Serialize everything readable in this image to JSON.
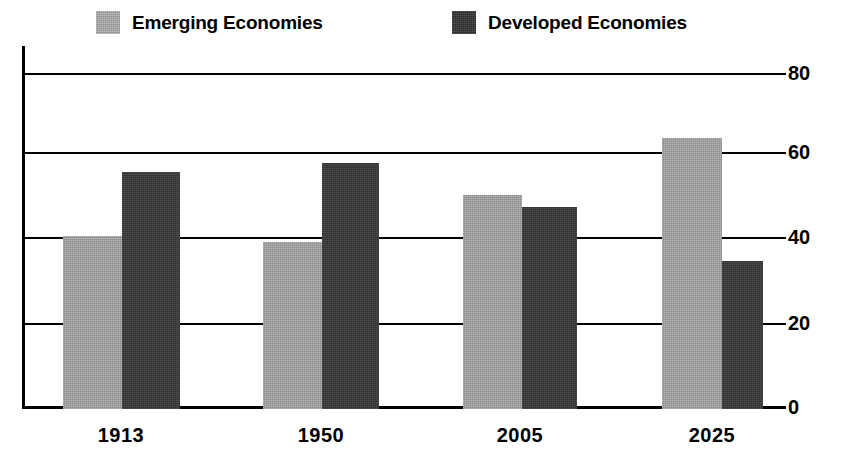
{
  "chart_data": {
    "type": "bar",
    "title": "",
    "subtitle": "",
    "xlabel": "",
    "ylabel": "",
    "categories": [
      "1913",
      "1950",
      "2005",
      "2025"
    ],
    "series": [
      {
        "name": "Emerging Economies",
        "values": [
          41.5,
          40,
          51.5,
          65
        ],
        "color": "#8c8c8c"
      },
      {
        "name": "Developed Economies",
        "values": [
          57,
          59,
          48.5,
          35.5
        ],
        "color": "#303030"
      }
    ],
    "ylim": [
      0,
      80
    ],
    "yticks": [
      0,
      20,
      40,
      60,
      80
    ],
    "ytick_labels": [
      "0",
      "20",
      "40",
      "60",
      "80"
    ],
    "grid": true,
    "y_axis_side": "right",
    "legend_position": "top"
  },
  "legend": {
    "items": [
      {
        "label": "Emerging Economies",
        "swatch": "legend-swatch-emerging"
      },
      {
        "label": "Developed Economies",
        "swatch": "legend-swatch-developed"
      }
    ]
  }
}
